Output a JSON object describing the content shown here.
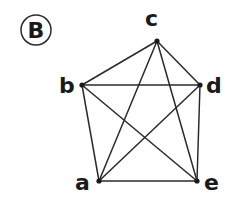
{
  "figure": {
    "badge_label": "B",
    "line_color": "#2a2a2a",
    "vertices": [
      {
        "id": "a",
        "label": "a",
        "x": 99,
        "y": 181
      },
      {
        "id": "b",
        "label": "b",
        "x": 82,
        "y": 85
      },
      {
        "id": "c",
        "label": "c",
        "x": 157,
        "y": 41
      },
      {
        "id": "d",
        "label": "d",
        "x": 200,
        "y": 85
      },
      {
        "id": "e",
        "label": "e",
        "x": 197,
        "y": 181
      }
    ],
    "edges": [
      [
        "a",
        "b"
      ],
      [
        "a",
        "c"
      ],
      [
        "a",
        "d"
      ],
      [
        "a",
        "e"
      ],
      [
        "b",
        "c"
      ],
      [
        "b",
        "d"
      ],
      [
        "b",
        "e"
      ],
      [
        "c",
        "d"
      ],
      [
        "c",
        "e"
      ],
      [
        "d",
        "e"
      ]
    ]
  }
}
